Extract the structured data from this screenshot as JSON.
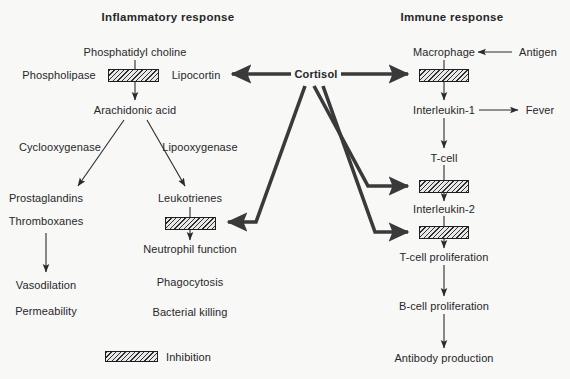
{
  "diagram": {
    "background_color": "#f8f8f7",
    "ink_color": "#272727",
    "hatch_color": "#2e2e2e"
  },
  "headings": {
    "left": "Inflammatory response",
    "right": "Immune response"
  },
  "center": {
    "hub_label": "Cortisol"
  },
  "inflammatory": {
    "nodes": [
      {
        "id": "phosphatidyl_choline",
        "label": "Phosphatidyl choline",
        "x": 135,
        "y": 52
      },
      {
        "id": "phospholipase",
        "label": "Phospholipase",
        "x": 59,
        "y": 75
      },
      {
        "id": "lipocortin",
        "label": "Lipocortin",
        "x": 196,
        "y": 75
      },
      {
        "id": "arachidonic_acid",
        "label": "Arachidonic acid",
        "x": 135,
        "y": 110
      },
      {
        "id": "cyclooxygenase",
        "label": "Cyclooxygenase",
        "x": 60,
        "y": 147
      },
      {
        "id": "lipooxygenase",
        "label": "Lipooxygenase",
        "x": 200,
        "y": 147
      },
      {
        "id": "prostaglandins",
        "label": "Prostaglandins",
        "x": 46,
        "y": 198
      },
      {
        "id": "thromboxanes",
        "label": "Thromboxanes",
        "x": 46,
        "y": 221
      },
      {
        "id": "leukotrienes",
        "label": "Leukotrienes",
        "x": 190,
        "y": 198
      },
      {
        "id": "neutrophil_function",
        "label": "Neutrophil function",
        "x": 190,
        "y": 249
      },
      {
        "id": "phagocytosis",
        "label": "Phagocytosis",
        "x": 190,
        "y": 282
      },
      {
        "id": "bacterial_killing",
        "label": "Bacterial killing",
        "x": 190,
        "y": 312
      },
      {
        "id": "vasodilation",
        "label": "Vasodilation",
        "x": 46,
        "y": 285
      },
      {
        "id": "permeability",
        "label": "Permeability",
        "x": 46,
        "y": 311
      }
    ]
  },
  "immune": {
    "nodes": [
      {
        "id": "macrophage",
        "label": "Macrophage",
        "x": 444,
        "y": 52
      },
      {
        "id": "antigen",
        "label": "Antigen",
        "x": 538,
        "y": 52
      },
      {
        "id": "interleukin_1",
        "label": "Interleukin-1",
        "x": 444,
        "y": 110
      },
      {
        "id": "fever",
        "label": "Fever",
        "x": 540,
        "y": 110
      },
      {
        "id": "t_cell",
        "label": "T-cell",
        "x": 444,
        "y": 158
      },
      {
        "id": "interleukin_2",
        "label": "Interleukin-2",
        "x": 444,
        "y": 209
      },
      {
        "id": "t_cell_proliferation",
        "label": "T-cell proliferation",
        "x": 444,
        "y": 257
      },
      {
        "id": "b_cell_proliferation",
        "label": "B-cell proliferation",
        "x": 444,
        "y": 306
      },
      {
        "id": "antibody_production",
        "label": "Antibody production",
        "x": 444,
        "y": 358
      }
    ]
  },
  "inhibition_boxes": [
    {
      "id": "box-phospholipase",
      "x": 108,
      "y": 69,
      "w": 51,
      "h": 13
    },
    {
      "id": "box-leukotrienes",
      "x": 165,
      "y": 217,
      "w": 51,
      "h": 13
    },
    {
      "id": "box-macrophage",
      "x": 419,
      "y": 69,
      "w": 50,
      "h": 13
    },
    {
      "id": "box-t-cell",
      "x": 419,
      "y": 180,
      "w": 50,
      "h": 13
    },
    {
      "id": "box-interleukin-2",
      "x": 419,
      "y": 226,
      "w": 50,
      "h": 13
    }
  ],
  "legend": {
    "label": "Inhibition",
    "swatch": {
      "x": 105,
      "y": 351,
      "w": 53,
      "h": 11
    },
    "label_x": 166,
    "label_y": 357
  }
}
